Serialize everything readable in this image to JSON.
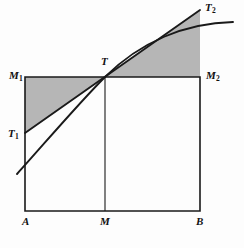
{
  "figure": {
    "kind": "geometry-diagram",
    "background_color": "#fdfdfd",
    "shade_color": "#b6b6b6",
    "stroke_color": "#1a1a1a"
  },
  "labels": {
    "M1": {
      "text": "M",
      "sub": "1",
      "name": "label-M1"
    },
    "M2": {
      "text": "M",
      "sub": "2",
      "name": "label-M2"
    },
    "T": {
      "text": "T",
      "sub": "",
      "name": "label-T"
    },
    "T1": {
      "text": "T",
      "sub": "1",
      "name": "label-T1"
    },
    "T2": {
      "text": "T",
      "sub": "2",
      "name": "label-T2"
    },
    "A": {
      "text": "A",
      "sub": "",
      "name": "label-A"
    },
    "M": {
      "text": "M",
      "sub": "",
      "name": "label-M"
    },
    "B": {
      "text": "B",
      "sub": "",
      "name": "label-B"
    }
  },
  "chart_data": {
    "type": "line",
    "xlabel": "",
    "ylabel": "",
    "grid": false,
    "legend": null,
    "axis_ranges": {
      "x_px": [
        25,
        200
      ],
      "y_px": [
        10,
        211
      ]
    },
    "points": {
      "A": {
        "x": 25,
        "y": 211
      },
      "B": {
        "x": 200,
        "y": 211
      },
      "M": {
        "x": 105,
        "y": 211
      },
      "M1": {
        "x": 25,
        "y": 77
      },
      "M2": {
        "x": 200,
        "y": 77
      },
      "T": {
        "x": 105,
        "y": 77
      },
      "T1": {
        "x": 25,
        "y": 133
      },
      "T2": {
        "x": 200,
        "y": 10
      }
    },
    "rectangle_path": "M25,77 L200,77 L200,211 L25,211 Z",
    "midline_path": "M105,77 L105,211",
    "tangent_path": "M25,133 L200,10",
    "curve_path": "M17,174 C45,143 78,104 105,77 C140,42 185,23 233,22",
    "shaded_left_path": "M25,77 L105,77 L25,133 Z",
    "shaded_right_path": "M105,77 L200,77 L200,10 Z",
    "series": [
      {
        "name": "curve",
        "description": "concave increasing curve through T",
        "x": [
          17,
          40,
          62,
          85,
          105,
          130,
          155,
          180,
          205,
          233
        ],
        "y": [
          174,
          148,
          124,
          98,
          77,
          57,
          43,
          33,
          26,
          22
        ]
      },
      {
        "name": "tangent",
        "description": "tangent to the curve at T, from T1 to T2",
        "x": [
          25,
          105,
          200
        ],
        "y": [
          133,
          77,
          10
        ]
      }
    ]
  }
}
